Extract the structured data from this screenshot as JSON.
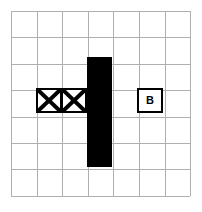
{
  "figure": {
    "kind": "grid-diagram",
    "background_color": "#ffffff",
    "width": 202,
    "height": 212
  },
  "grid": {
    "columns": 7,
    "rows": 7,
    "origin_x": 11,
    "origin_y": 11,
    "cell_width": 25.6,
    "cell_height": 26.4,
    "line_color": "#b0b0b0",
    "line_width": 1
  },
  "shapes": {
    "black_bar": {
      "name": "black-bar",
      "color": "#000000",
      "col": 3,
      "row_start": 1,
      "row_span": 4,
      "x": 87,
      "y": 57,
      "width": 25,
      "height": 110
    },
    "x_boxes": [
      {
        "name": "x-box-left",
        "col": 1,
        "row": 3,
        "x": 36,
        "y": 88,
        "width": 26,
        "height": 25,
        "border_color": "#000000",
        "border_width": 2,
        "fill": "#ffffff",
        "marker": "cross"
      },
      {
        "name": "x-box-right",
        "col": 2,
        "row": 3,
        "x": 61,
        "y": 88,
        "width": 26,
        "height": 25,
        "border_color": "#000000",
        "border_width": 2,
        "fill": "#ffffff",
        "marker": "cross"
      }
    ],
    "labeled_box": {
      "name": "labeled-box-b",
      "label": "B",
      "col": 5,
      "row": 3,
      "x": 137,
      "y": 88,
      "width": 26,
      "height": 25,
      "border_color": "#000000",
      "border_width": 2,
      "fill": "#ffffff",
      "text_color": "#000000"
    }
  }
}
